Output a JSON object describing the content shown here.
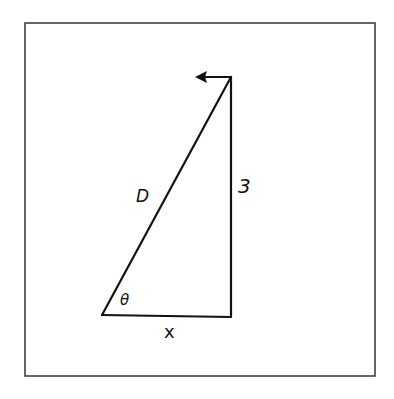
{
  "diagram": {
    "type": "right-triangle",
    "labels": {
      "hypotenuse": "D",
      "vertical_side": "3",
      "horizontal_side": "x",
      "angle": "θ"
    },
    "arrow": {
      "direction": "left",
      "at": "top-vertex"
    },
    "colors": {
      "stroke": "#111111",
      "frame": "#333333",
      "background": "#ffffff"
    }
  }
}
